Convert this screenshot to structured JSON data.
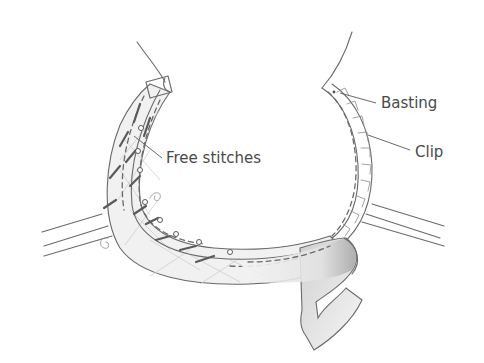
{
  "illustration": {
    "subject": "Armhole with bias facing being stitched",
    "labels": {
      "basting": "Basting",
      "clip": "Clip",
      "free_stitches": "Free stitches"
    },
    "colors": {
      "line": "#6a6a6a",
      "label_text": "#4a4a4a",
      "fabric_fill": "#f2f2f2",
      "shadow": "#bdbdbd",
      "background": "#ffffff"
    }
  }
}
